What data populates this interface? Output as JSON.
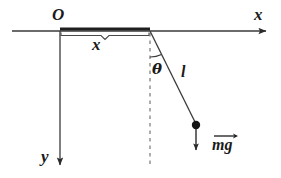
{
  "figure": {
    "type": "physics-free-body-diagram",
    "background_color": "#ffffff",
    "stroke_color": "#2b2b2b",
    "labels": {
      "origin": "O",
      "x_axis": "x",
      "y_axis": "y",
      "horizontal_displacement": "x",
      "angle": "θ",
      "string_length": "l",
      "weight_vector": "mg"
    },
    "geometry": {
      "origin_point": [
        60,
        31
      ],
      "pivot_point": [
        150,
        31
      ],
      "bob_point": [
        196,
        125
      ],
      "x_axis_start": [
        12,
        31
      ],
      "x_axis_end": [
        268,
        31
      ],
      "y_axis_end": [
        60,
        168
      ],
      "dashed_vertical_end": [
        150,
        166
      ],
      "weight_arrow_end": [
        196,
        154
      ],
      "bob_radius": 4,
      "angle_arc_radius": 26,
      "angle_degrees": 26
    }
  }
}
